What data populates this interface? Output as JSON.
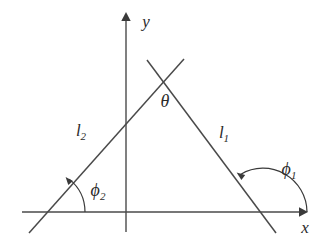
{
  "figure": {
    "type": "line-diagram",
    "background_color": "#ffffff",
    "stroke_color": "#4a4a4a",
    "label_color": "#2b2b2b"
  },
  "axes": {
    "x_axis": {
      "label": "x",
      "name": "x-axis",
      "y_pixel": 212,
      "x_start": 22,
      "x_end": 305,
      "arrow": "right",
      "label_x": 305,
      "label_y": 229
    },
    "y_axis": {
      "label": "y",
      "name": "y-axis",
      "x_pixel": 126,
      "y_start": 232,
      "y_end": 13,
      "arrow": "up",
      "label_x": 146,
      "label_y": 23
    },
    "origin": {
      "x": 126,
      "y": 212
    }
  },
  "lines": [
    {
      "id": "l1",
      "label": "l",
      "subscript": "1",
      "label_x": 224,
      "label_y": 134,
      "from": {
        "x": 147,
        "y": 60
      },
      "to": {
        "x": 276,
        "y": 233
      },
      "x_intercept": 263,
      "description": "line descending to the right, crossing the x-axis"
    },
    {
      "id": "l2",
      "label": "l",
      "subscript": "2",
      "label_x": 81,
      "label_y": 132,
      "from": {
        "x": 29,
        "y": 233
      },
      "to": {
        "x": 184,
        "y": 59
      },
      "x_intercept": 43,
      "description": "line ascending to the right, crossing the x-axis"
    }
  ],
  "intersection": {
    "x": 163,
    "y": 78,
    "name": "apex-crossing"
  },
  "angles": [
    {
      "id": "theta",
      "label": "θ",
      "name": "angle-theta",
      "label_x": 165,
      "label_y": 103,
      "description": "angle between l1 and l2 below the crossing point"
    },
    {
      "id": "phi1",
      "label": "ϕ",
      "subscript": "1",
      "name": "angle-phi-1",
      "label_x": 289,
      "label_y": 171,
      "vertex": {
        "x": 263,
        "y": 212
      },
      "arc_radius": 44,
      "description": "obtuse angle from positive x-axis counterclockwise to line l1"
    },
    {
      "id": "phi2",
      "label": "ϕ",
      "subscript": "2",
      "name": "angle-phi-2",
      "label_x": 98,
      "label_y": 192,
      "vertex": {
        "x": 43,
        "y": 212
      },
      "arc_radius": 42,
      "description": "acute angle from positive x-axis counterclockwise to line l2"
    }
  ]
}
